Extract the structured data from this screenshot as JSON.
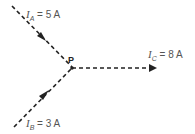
{
  "diagram": {
    "type": "circuit-junction",
    "node": {
      "label": "P"
    },
    "currents": [
      {
        "symbol": "I",
        "subscript": "A",
        "value": "5 A",
        "direction": "into P"
      },
      {
        "symbol": "I",
        "subscript": "B",
        "value": "3 A",
        "direction": "into P"
      },
      {
        "symbol": "I",
        "subscript": "C",
        "value": "8 A",
        "direction": "out of P"
      }
    ]
  }
}
